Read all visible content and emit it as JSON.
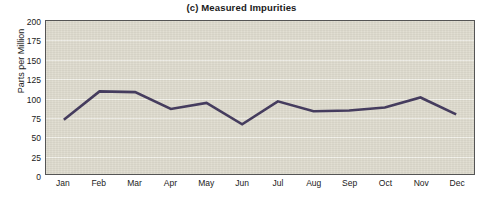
{
  "chart_data": {
    "type": "line",
    "title": "(c) Measured Impurities",
    "xlabel": "",
    "ylabel": "Parts per Million",
    "categories": [
      "Jan",
      "Feb",
      "Mar",
      "Apr",
      "May",
      "Jun",
      "Jul",
      "Aug",
      "Sep",
      "Oct",
      "Nov",
      "Dec"
    ],
    "values": [
      71,
      108,
      107,
      85,
      93,
      65,
      95,
      82,
      83,
      87,
      100,
      78
    ],
    "series": [
      {
        "name": "Measured Impurities",
        "values": [
          71,
          108,
          107,
          85,
          93,
          65,
          95,
          82,
          83,
          87,
          100,
          78
        ]
      }
    ],
    "ylim": [
      0,
      200
    ],
    "y_ticks": [
      200,
      175,
      150,
      125,
      100,
      75,
      50,
      25,
      0
    ],
    "y_tick_step": 25,
    "grid": true,
    "grid_axis": "y",
    "legend": "none",
    "line_color": "#453c5e",
    "plot_background": "#dedbce",
    "gridline_color": "#f2f1ea",
    "axis_border_color": "#555555",
    "text_color": "#1a1a1a"
  }
}
